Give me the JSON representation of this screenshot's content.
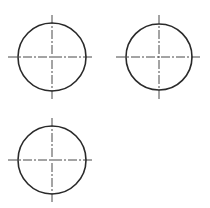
{
  "diagram": {
    "type": "technical-drawing-circles-with-centerlines",
    "background": "#ffffff",
    "stroke_color": "#2a2a2a",
    "centerline_color": "#333333",
    "circles": [
      {
        "id": "circle-top-left",
        "cx": 52,
        "cy": 57,
        "r": 34,
        "h_line": [
          8,
          94
        ],
        "v_line": [
          15,
          99
        ]
      },
      {
        "id": "circle-top-right",
        "cx": 159,
        "cy": 57,
        "r": 33,
        "h_line": [
          116,
          201
        ],
        "v_line": [
          15,
          99
        ]
      },
      {
        "id": "circle-bottom-left",
        "cx": 52,
        "cy": 160,
        "r": 34,
        "h_line": [
          8,
          94
        ],
        "v_line": [
          118,
          202
        ]
      }
    ]
  }
}
